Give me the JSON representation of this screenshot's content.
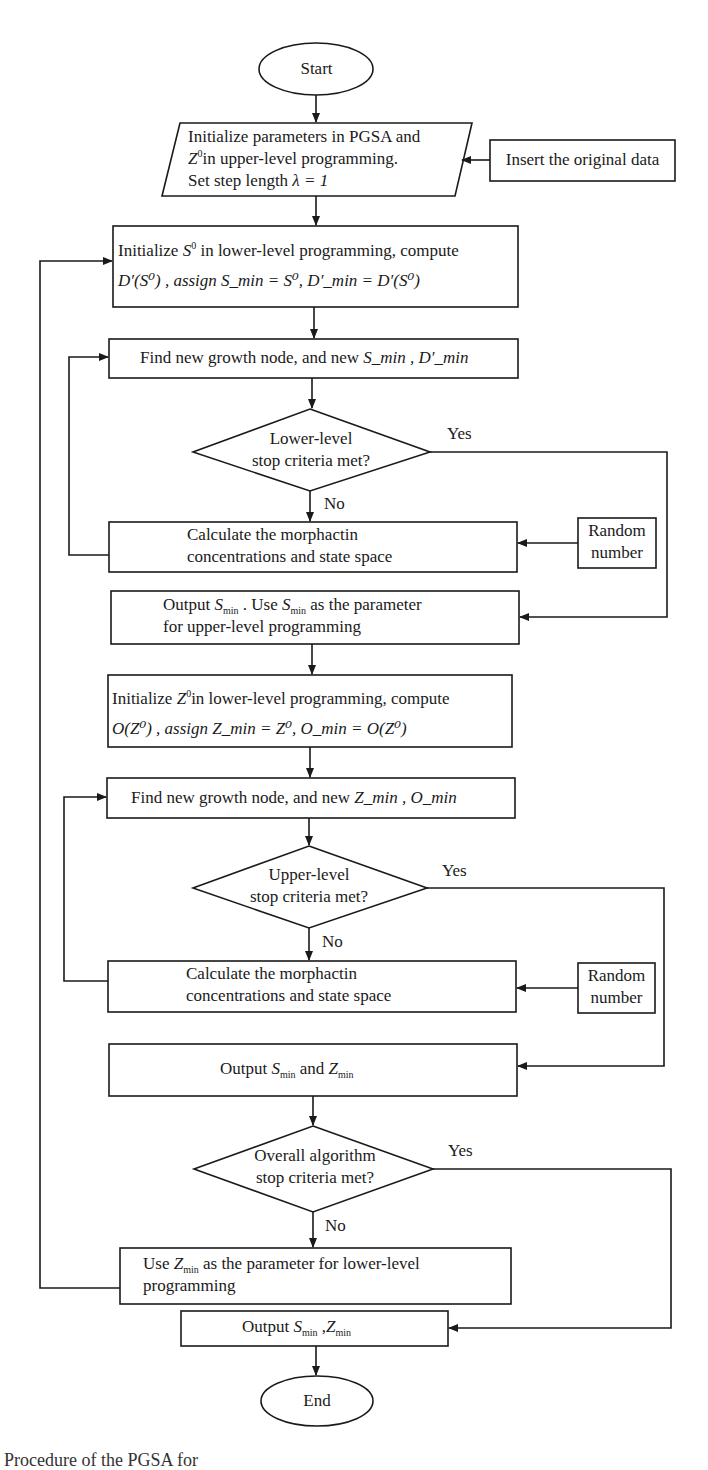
{
  "flowchart": {
    "start": "Start",
    "end": "End",
    "init_upper": {
      "line1": "Initialize parameters in PGSA and",
      "line2_var": "Z",
      "line2_sup": "0",
      "line2_rest": "in upper-level programming.",
      "line3_pre": "Set step length",
      "line3_math": "λ = 1"
    },
    "insert_data": "Insert the original data",
    "init_lower": {
      "pre": "Initialize",
      "var": "S",
      "sup": "0",
      "rest": "in lower-level programming, compute",
      "line2": "D′(S⁰) , assign S_min = S⁰, D′_min = D′(S⁰)"
    },
    "find_s": {
      "text": "Find new growth node, and new",
      "vars": "S_min , D′_min"
    },
    "decision_lower": {
      "line1": "Lower-level",
      "line2": "stop criteria met?",
      "yes": "Yes",
      "no": "No"
    },
    "calc_1": {
      "line1": "Calculate the morphactin",
      "line2": "concentrations and state space"
    },
    "random_1": {
      "line1": "Random",
      "line2": "number"
    },
    "output_s": {
      "line1_pre": "Output",
      "line1_mid": ". Use",
      "line1_post": "as the parameter",
      "line2": "for upper-level programming"
    },
    "init_z": {
      "pre": "Initialize",
      "rest": "in lower-level programming, compute",
      "line2": "O(Z⁰) , assign Z_min = Z⁰, O_min = O(Z⁰)"
    },
    "find_z": {
      "text": "Find new growth node, and new",
      "vars": "Z_min , O_min"
    },
    "decision_upper": {
      "line1": "Upper-level",
      "line2": "stop criteria met?",
      "yes": "Yes",
      "no": "No"
    },
    "calc_2": {
      "line1": "Calculate the morphactin",
      "line2": "concentrations and state space"
    },
    "random_2": {
      "line1": "Random",
      "line2": "number"
    },
    "output_sz": {
      "pre": "Output",
      "mid": "and"
    },
    "decision_overall": {
      "line1": "Overall algorithm",
      "line2": "stop criteria met?",
      "yes": "Yes",
      "no": "No"
    },
    "use_z": {
      "pre": "Use",
      "post": "as the parameter for lower-level",
      "line2": "programming"
    },
    "output_final": {
      "pre": "Output"
    },
    "math": {
      "S": "S",
      "Z": "Z",
      "D": "D",
      "O": "O",
      "min": "min",
      "sup0": "0",
      "prime": "′"
    }
  },
  "caption": "Procedure of the PGSA for"
}
